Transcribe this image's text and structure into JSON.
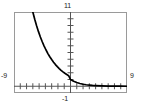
{
  "window": {
    "xmin_label": "-9",
    "xmax_label": "9",
    "ymin_label": "-1",
    "ymax_label": "11"
  },
  "colors": {
    "curve": "#000000",
    "frame": "#9a9a9a",
    "axis": "#555555",
    "background": "#ffffff",
    "text": "#1a1a1a"
  },
  "chart_data": {
    "type": "line",
    "title": "",
    "xlabel": "",
    "ylabel": "",
    "xlim": [
      -9,
      9
    ],
    "ylim": [
      -1,
      11
    ],
    "xticks": [
      -8,
      -7,
      -6,
      -5,
      -4,
      -3,
      -2,
      -1,
      0,
      1,
      2,
      3,
      4,
      5,
      6,
      7,
      8
    ],
    "yticks": [
      1,
      2,
      3,
      4,
      5,
      6,
      7,
      8,
      9,
      10
    ],
    "xtick_labels": [
      "-9",
      "9"
    ],
    "ytick_labels": [
      "-1",
      "11"
    ],
    "grid": false,
    "legend": null,
    "annotations": [],
    "series": [
      {
        "name": "exponential decay",
        "expression": "y = 0.55^x",
        "x": [
          -6.0,
          -5.7,
          -5.4,
          -5.1,
          -4.8,
          -4.5,
          -4.2,
          -3.9,
          -3.6,
          -3.3,
          -3.0,
          -2.7,
          -2.4,
          -2.1,
          -1.8,
          -1.5,
          -1.2,
          -0.9,
          -0.6,
          -0.3,
          0.0,
          0.5,
          1.0,
          1.5,
          2.0,
          2.5,
          3.0,
          3.5,
          4.0,
          5.0,
          6.0,
          7.0,
          8.0,
          9.0
        ],
        "y": [
          11.0,
          9.93,
          8.96,
          8.09,
          7.3,
          6.59,
          5.95,
          5.37,
          4.84,
          4.37,
          3.95,
          3.56,
          3.21,
          2.9,
          2.62,
          2.36,
          2.13,
          1.92,
          1.74,
          1.57,
          1.0,
          0.74,
          0.55,
          0.41,
          0.3,
          0.22,
          0.17,
          0.12,
          0.09,
          0.05,
          0.03,
          0.02,
          0.01,
          0.0
        ]
      }
    ]
  }
}
